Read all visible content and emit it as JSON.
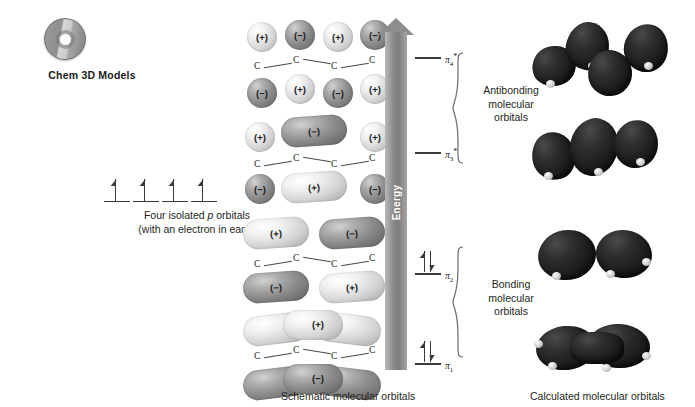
{
  "badge": {
    "icon": "cd-disc-icon",
    "label": "Chem 3D Models"
  },
  "p_orbitals": {
    "count": 4,
    "caption_line1_pre": "Four isolated ",
    "caption_line1_em": "p",
    "caption_line1_post": " orbitals",
    "caption_line2": "(with an electron in each)",
    "electron_symbol": "up-arrow"
  },
  "energy_axis": {
    "label": "Energy",
    "direction": "up"
  },
  "groups": [
    {
      "name": "antibonding",
      "label_line1": "Antibonding",
      "label_line2": "molecular",
      "label_line3": "orbitals"
    },
    {
      "name": "bonding",
      "label_line1": "Bonding",
      "label_line2": "molecular",
      "label_line3": "orbitals"
    }
  ],
  "levels": [
    {
      "id": "pi4",
      "symbol": "π",
      "sub": "4",
      "sup": "*",
      "electrons": 0,
      "group": "antibonding"
    },
    {
      "id": "pi3",
      "symbol": "π",
      "sub": "3",
      "sup": "*",
      "electrons": 0,
      "group": "antibonding"
    },
    {
      "id": "pi2",
      "symbol": "π",
      "sub": "2",
      "sup": "",
      "electrons": 2,
      "group": "bonding"
    },
    {
      "id": "pi1",
      "symbol": "π",
      "sub": "1",
      "sup": "",
      "electrons": 2,
      "group": "bonding"
    }
  ],
  "schematic": {
    "caption": "Schematic molecular orbitals",
    "atom_label": "C",
    "atom_count": 4,
    "orbitals": [
      {
        "id": "pi4",
        "nodes": 3,
        "top_signs": [
          "(+)",
          "(−)",
          "(+)",
          "(−)"
        ],
        "bottom_signs": [
          "(−)",
          "(+)",
          "(−)",
          "(+)"
        ],
        "top_shades": [
          "light",
          "dark",
          "light",
          "dark"
        ],
        "bottom_shades": [
          "dark",
          "light",
          "dark",
          "light"
        ]
      },
      {
        "id": "pi3",
        "nodes": 2,
        "top_signs": [
          "(+)",
          "(−)",
          "(+)"
        ],
        "bottom_signs": [
          "(−)",
          "(+)",
          "(−)"
        ],
        "top_shades": [
          "light",
          "dark",
          "light"
        ],
        "bottom_shades": [
          "dark",
          "light",
          "dark"
        ]
      },
      {
        "id": "pi2",
        "nodes": 1,
        "top_signs": [
          "(+)",
          "(−)"
        ],
        "bottom_signs": [
          "(−)",
          "(+)"
        ],
        "top_shades": [
          "light",
          "dark"
        ],
        "bottom_shades": [
          "dark",
          "light"
        ]
      },
      {
        "id": "pi1",
        "nodes": 0,
        "top_signs": [
          "(+)"
        ],
        "bottom_signs": [
          "(−)"
        ],
        "top_shades": [
          "light"
        ],
        "bottom_shades": [
          "dark"
        ]
      }
    ]
  },
  "calculated": {
    "caption": "Calculated molecular orbitals",
    "orbitals": [
      {
        "id": "pi4",
        "lobe_count": 4
      },
      {
        "id": "pi3",
        "lobe_count": 3
      },
      {
        "id": "pi2",
        "lobe_count": 2
      },
      {
        "id": "pi1",
        "lobe_count": 1
      }
    ]
  },
  "colors": {
    "positive_lobe": "#e4e4e4",
    "negative_lobe": "#8c8c8c",
    "energy_arrow": "#8d8d8d",
    "calculated_lobe": "#1c1c1c",
    "text": "#231f20"
  }
}
